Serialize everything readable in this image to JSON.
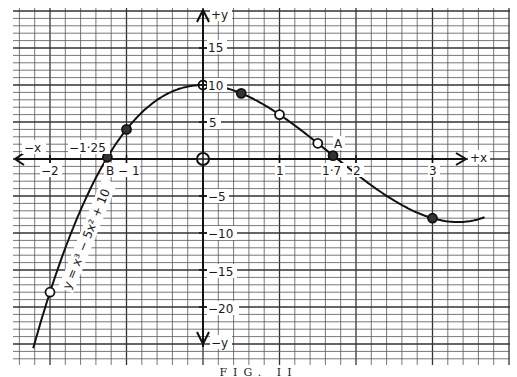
{
  "chart_data": {
    "type": "line",
    "title": "",
    "equation_label": "y = x³ − 5x² + 10",
    "xlabel_pos": "+x",
    "xlabel_neg": "−x",
    "ylabel_pos": "+y",
    "ylabel_neg": "−y",
    "xlim": [
      -2.5,
      4.0
    ],
    "ylim": [
      -24,
      21
    ],
    "x_ticks": [
      -2,
      -1,
      1,
      2,
      3
    ],
    "x_tick_labels": [
      "−2",
      "B −1",
      "1",
      "2",
      "3"
    ],
    "y_ticks": [
      15,
      10,
      5,
      -5,
      -10,
      -15,
      -20
    ],
    "y_tick_labels": [
      "15",
      "10",
      "5",
      "−5",
      "−10",
      "−15",
      "−20"
    ],
    "grid": true,
    "series": [
      {
        "name": "y = x³ − 5x² + 10",
        "x": [
          -2,
          -1.25,
          -1,
          0,
          0.5,
          1,
          1.5,
          1.7,
          3
        ],
        "y": [
          -18,
          0.23,
          4,
          10,
          8.88,
          6,
          2.13,
          0.46,
          -8
        ]
      }
    ],
    "annotations": [
      {
        "text": "−1·25",
        "x": -1.25,
        "y": 0,
        "note": "root B"
      },
      {
        "text": "B",
        "x": -1.25,
        "y": 0
      },
      {
        "text": "A",
        "x": 1.7,
        "y": 0
      },
      {
        "text": "1·7",
        "x": 1.7,
        "y": 0,
        "note": "root A"
      },
      {
        "text": "O",
        "x": 0,
        "y": 0,
        "note": "origin circle"
      }
    ]
  },
  "figure": {
    "caption": "FIG. II",
    "labels": {
      "plus_x": "+x",
      "minus_x": "−x",
      "plus_y": "+y",
      "minus_y": "−y",
      "x_neg2": "−2",
      "x_neg1": "B − 1",
      "x_1": "1",
      "x_2": "2",
      "x_3": "3",
      "root_b": "−1·25",
      "root_a": "1·7",
      "point_a": "A",
      "y_15": "15",
      "y_10": "10",
      "y_5": "5",
      "y_m5": "−5",
      "y_m10": "−10",
      "y_m15": "−15",
      "y_m20": "−20",
      "equation": "y = x³ − 5x² + 10"
    }
  }
}
